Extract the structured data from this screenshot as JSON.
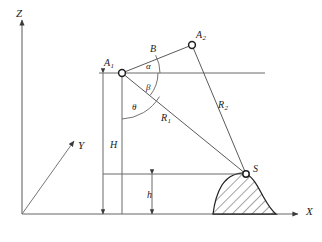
{
  "figure": {
    "type": "geometry-diagram",
    "width": 322,
    "height": 242,
    "background_color": "#ffffff",
    "line_color": "#555555",
    "text_color": "#1a1a1a"
  },
  "axes": {
    "z": {
      "label": "Z",
      "label_x": 16,
      "label_y": 8
    },
    "y": {
      "label": "Y",
      "label_x": 78,
      "label_y": 140
    },
    "x": {
      "label": "X",
      "label_x": 306,
      "label_y": 206
    },
    "origin": {
      "x": 22,
      "y": 214
    }
  },
  "points": [
    {
      "name": "A1",
      "label": "A",
      "subscript": "1",
      "label_x": 104,
      "label_y": 58,
      "cx": 122,
      "cy": 73
    },
    {
      "name": "A2",
      "label": "A",
      "subscript": "2",
      "label_x": 196,
      "label_y": 30,
      "cx": 192,
      "cy": 45
    },
    {
      "name": "S",
      "label": "S",
      "subscript": "",
      "label_x": 253,
      "label_y": 164,
      "cx": 246,
      "cy": 174
    }
  ],
  "segments": [
    {
      "name": "B",
      "label": "B",
      "subscript": "",
      "label_x": 150,
      "label_y": 44
    },
    {
      "name": "R1",
      "label": "R",
      "subscript": "1",
      "label_x": 161,
      "label_y": 113
    },
    {
      "name": "R2",
      "label": "R",
      "subscript": "2",
      "label_x": 218,
      "label_y": 100
    }
  ],
  "dimensions": [
    {
      "name": "H",
      "label": "H",
      "label_x": 110,
      "label_y": 140,
      "from_y": 73,
      "to_y": 214,
      "axis_x": 103
    },
    {
      "name": "h",
      "label": "h",
      "label_x": 147,
      "label_y": 190,
      "from_y": 174,
      "to_y": 214,
      "axis_x": 152
    }
  ],
  "angles": [
    {
      "name": "alpha",
      "label": "α",
      "label_x": 146,
      "label_y": 62
    },
    {
      "name": "beta",
      "label": "β",
      "label_x": 146,
      "label_y": 83
    },
    {
      "name": "theta",
      "label": "θ",
      "label_x": 132,
      "label_y": 103
    }
  ],
  "terrain": {
    "name": "hatched-hill",
    "summit_point": "S",
    "hatch_angle_deg": 45,
    "hatch_color": "#333333",
    "outline_color": "#222222"
  }
}
